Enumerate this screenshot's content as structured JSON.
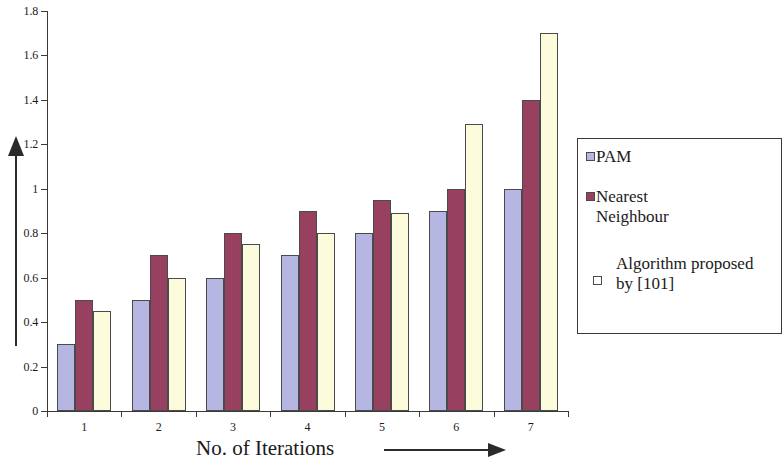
{
  "chart_data": {
    "type": "bar",
    "title": "",
    "xlabel": "No. of Iterations",
    "ylabel": "",
    "categories": [
      "1",
      "2",
      "3",
      "4",
      "5",
      "6",
      "7"
    ],
    "ylim": [
      0,
      1.8
    ],
    "ytick_labels": [
      "0",
      "0.2",
      "0.4",
      "0.6",
      "0.8",
      "1",
      "1.2",
      "1.4",
      "1.6",
      "1.8"
    ],
    "ytick_values": [
      0,
      0.2,
      0.4,
      0.6,
      0.8,
      1,
      1.2,
      1.4,
      1.6,
      1.8
    ],
    "grid": false,
    "legend_position": "right",
    "series": [
      {
        "name": "PAM",
        "color": "#b6b6e2",
        "values": [
          0.3,
          0.5,
          0.6,
          0.7,
          0.8,
          0.9,
          1.0
        ]
      },
      {
        "name": "Nearest\nNeighbour",
        "color": "#98405f",
        "values": [
          0.5,
          0.7,
          0.8,
          0.9,
          0.95,
          1.0,
          1.4
        ]
      },
      {
        "name": "Algorithm proposed\nby [101]",
        "color": "#fcfcdc",
        "values": [
          0.45,
          0.6,
          0.75,
          0.8,
          0.89,
          1.29,
          1.7
        ]
      }
    ]
  },
  "axes": {
    "x_title": "No. of Iterations",
    "x_arrow": "right-arrow",
    "y_arrow": "up-arrow"
  },
  "legend": {
    "entries": [
      {
        "label": "PAM",
        "swatch": "pam-swatch"
      },
      {
        "label": "Nearest\nNeighbour",
        "swatch": "nearest-neighbour-swatch"
      },
      {
        "label": "Algorithm proposed\nby [101]",
        "swatch": "algorithm-proposed-swatch"
      }
    ]
  }
}
